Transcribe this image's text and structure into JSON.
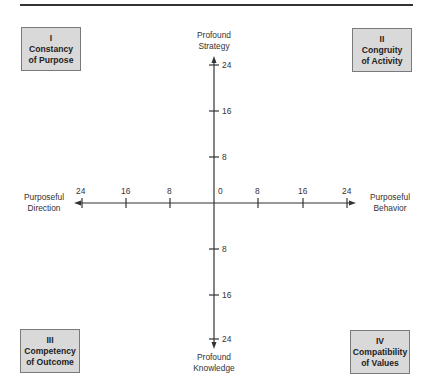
{
  "diagram": {
    "type": "quadrant",
    "colors": {
      "box_fill": "#d9d9d9",
      "box_border": "#7a7a7a",
      "axis": "#333333",
      "text": "#2a2a2a"
    },
    "quadrants": [
      {
        "id": "q1",
        "numeral": "I",
        "line1": "Constancy",
        "line2": "of Purpose"
      },
      {
        "id": "q2",
        "numeral": "II",
        "line1": "Congruity",
        "line2": "of Activity"
      },
      {
        "id": "q3",
        "numeral": "III",
        "line1": "Competency",
        "line2": "of Outcome"
      },
      {
        "id": "q4",
        "numeral": "IV",
        "line1": "Compatibility",
        "line2": "of Values"
      }
    ],
    "axes": {
      "top": {
        "line1": "Profound",
        "line2": "Strategy"
      },
      "bottom": {
        "line1": "Profound",
        "line2": "Knowledge"
      },
      "left": {
        "line1": "Purposeful",
        "line2": "Direction"
      },
      "right": {
        "line1": "Purposeful",
        "line2": "Behavior"
      }
    },
    "ticks": {
      "horizontal_left": [
        "24",
        "16",
        "8"
      ],
      "origin": "0",
      "horizontal_right": [
        "8",
        "16",
        "24"
      ],
      "vertical_up": [
        "8",
        "16",
        "24"
      ],
      "vertical_down": [
        "8",
        "16",
        "24"
      ]
    }
  }
}
